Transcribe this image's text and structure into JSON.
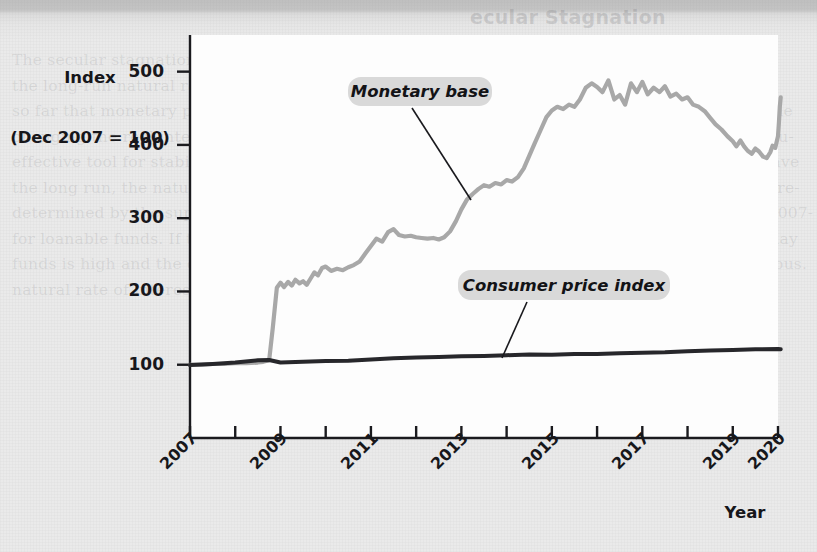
{
  "figure": {
    "y_axis_title_line1": "Index",
    "y_axis_title_line2": "(Dec 2007 = 100)",
    "x_axis_title": "Year"
  },
  "background_page": {
    "heading": "ecular Stagnation",
    "column_text_left": "The secular stagnation hypothesis argues that\nthe long-run natural rate of interest has fallen\nso far that monetary policy, which works by\nchanging the real interest rate, is no longer an\neffective tool for stabilizing the economy. Over\nthe long run, the natural rate of interest is\ndetermined by the supply of and the demand\nfor loanable funds. If the supply of loanable\nfunds is high and the demand is low, then the\nnatural rate of interest will be low.",
    "column_text_right": "There are several reasons why the supply of\nloanable funds may have increased and the\ndemand for loanable funds decreased over the\npast few decades. First, the aging of the popu-\nlation in many high-income countries may have\nincreased saving as workers prepare for retire-\nment. Second, the global financial crisis of 2007-\n2009 and the COVID-19 pandemic of 2020 may\nhave made households and firms more cautious."
  },
  "chart_data": {
    "type": "line",
    "title": "",
    "xlabel": "Year",
    "ylabel": "Index (Dec 2007 = 100)",
    "xlim": [
      2007,
      2020
    ],
    "ylim": [
      0,
      550
    ],
    "grid": false,
    "legend_position": "inline-annotation",
    "y_ticks": [
      100,
      200,
      300,
      400,
      500
    ],
    "x_ticks": [
      2007,
      2008,
      2009,
      2010,
      2011,
      2012,
      2013,
      2014,
      2015,
      2016,
      2017,
      2018,
      2019,
      2020
    ],
    "x_tick_labels": [
      "2007",
      "",
      "2009",
      "",
      "2011",
      "",
      "2013",
      "",
      "2015",
      "",
      "2017",
      "",
      "2019",
      "2020"
    ],
    "x_labeled_ticks": [
      {
        "x": 2007,
        "label": "2007"
      },
      {
        "x": 2009,
        "label": "2009"
      },
      {
        "x": 2011,
        "label": "2011"
      },
      {
        "x": 2013,
        "label": "2013"
      },
      {
        "x": 2015,
        "label": "2015"
      },
      {
        "x": 2017,
        "label": "2017"
      },
      {
        "x": 2019,
        "label": "2019"
      },
      {
        "x": 2020,
        "label": "2020"
      }
    ],
    "series": [
      {
        "name": "Monetary base",
        "label": "Monetary base",
        "color": "#a8a8a8",
        "width": 4.2,
        "annotation": {
          "text": "Monetary base",
          "box_x": 348,
          "box_y": 77,
          "box_w": 144,
          "box_h": 29,
          "leader_from": [
            412,
            108
          ],
          "leader_to": [
            471,
            200
          ]
        },
        "points": [
          [
            2007.0,
            100
          ],
          [
            2007.25,
            100
          ],
          [
            2007.5,
            101
          ],
          [
            2007.75,
            101
          ],
          [
            2008.0,
            102
          ],
          [
            2008.25,
            102
          ],
          [
            2008.5,
            103
          ],
          [
            2008.62,
            104
          ],
          [
            2008.75,
            106
          ],
          [
            2008.83,
            150
          ],
          [
            2008.92,
            205
          ],
          [
            2009.0,
            212
          ],
          [
            2009.08,
            206
          ],
          [
            2009.17,
            213
          ],
          [
            2009.25,
            208
          ],
          [
            2009.33,
            216
          ],
          [
            2009.42,
            211
          ],
          [
            2009.5,
            214
          ],
          [
            2009.58,
            209
          ],
          [
            2009.67,
            218
          ],
          [
            2009.75,
            226
          ],
          [
            2009.83,
            222
          ],
          [
            2009.92,
            232
          ],
          [
            2010.0,
            234
          ],
          [
            2010.12,
            228
          ],
          [
            2010.25,
            231
          ],
          [
            2010.38,
            229
          ],
          [
            2010.5,
            233
          ],
          [
            2010.62,
            236
          ],
          [
            2010.75,
            241
          ],
          [
            2010.88,
            252
          ],
          [
            2011.0,
            262
          ],
          [
            2011.12,
            272
          ],
          [
            2011.25,
            268
          ],
          [
            2011.38,
            281
          ],
          [
            2011.5,
            285
          ],
          [
            2011.62,
            277
          ],
          [
            2011.75,
            275
          ],
          [
            2011.88,
            276
          ],
          [
            2012.0,
            274
          ],
          [
            2012.12,
            273
          ],
          [
            2012.25,
            272
          ],
          [
            2012.38,
            273
          ],
          [
            2012.5,
            271
          ],
          [
            2012.62,
            274
          ],
          [
            2012.75,
            282
          ],
          [
            2012.88,
            296
          ],
          [
            2013.0,
            312
          ],
          [
            2013.12,
            325
          ],
          [
            2013.25,
            333
          ],
          [
            2013.38,
            340
          ],
          [
            2013.5,
            345
          ],
          [
            2013.62,
            343
          ],
          [
            2013.75,
            348
          ],
          [
            2013.88,
            346
          ],
          [
            2014.0,
            352
          ],
          [
            2014.12,
            350
          ],
          [
            2014.25,
            356
          ],
          [
            2014.38,
            368
          ],
          [
            2014.5,
            385
          ],
          [
            2014.62,
            402
          ],
          [
            2014.75,
            420
          ],
          [
            2014.88,
            438
          ],
          [
            2015.0,
            447
          ],
          [
            2015.12,
            452
          ],
          [
            2015.25,
            449
          ],
          [
            2015.38,
            455
          ],
          [
            2015.5,
            452
          ],
          [
            2015.62,
            462
          ],
          [
            2015.75,
            478
          ],
          [
            2015.88,
            484
          ],
          [
            2016.0,
            479
          ],
          [
            2016.12,
            472
          ],
          [
            2016.25,
            488
          ],
          [
            2016.38,
            462
          ],
          [
            2016.5,
            468
          ],
          [
            2016.62,
            455
          ],
          [
            2016.75,
            484
          ],
          [
            2016.88,
            472
          ],
          [
            2017.0,
            486
          ],
          [
            2017.12,
            469
          ],
          [
            2017.25,
            478
          ],
          [
            2017.38,
            472
          ],
          [
            2017.5,
            480
          ],
          [
            2017.62,
            466
          ],
          [
            2017.75,
            470
          ],
          [
            2017.88,
            462
          ],
          [
            2018.0,
            465
          ],
          [
            2018.12,
            455
          ],
          [
            2018.25,
            452
          ],
          [
            2018.38,
            446
          ],
          [
            2018.5,
            437
          ],
          [
            2018.62,
            428
          ],
          [
            2018.75,
            421
          ],
          [
            2018.88,
            412
          ],
          [
            2019.0,
            405
          ],
          [
            2019.08,
            398
          ],
          [
            2019.17,
            406
          ],
          [
            2019.25,
            398
          ],
          [
            2019.33,
            392
          ],
          [
            2019.42,
            388
          ],
          [
            2019.5,
            395
          ],
          [
            2019.58,
            391
          ],
          [
            2019.67,
            384
          ],
          [
            2019.75,
            382
          ],
          [
            2019.83,
            390
          ],
          [
            2019.88,
            399
          ],
          [
            2019.94,
            396
          ],
          [
            2020.0,
            412
          ],
          [
            2020.02,
            430
          ],
          [
            2020.04,
            452
          ],
          [
            2020.06,
            465
          ]
        ]
      },
      {
        "name": "Consumer price index",
        "label": "Consumer price index",
        "color": "#27272b",
        "width": 4.0,
        "annotation": {
          "text": "Consumer price index",
          "box_x": 458,
          "box_y": 270,
          "box_w": 212,
          "box_h": 30,
          "leader_from": [
            527,
            302
          ],
          "leader_to": [
            502,
            358
          ]
        },
        "points": [
          [
            2007.0,
            99.5
          ],
          [
            2007.5,
            101
          ],
          [
            2008.0,
            103
          ],
          [
            2008.5,
            106
          ],
          [
            2008.75,
            106.5
          ],
          [
            2009.0,
            103
          ],
          [
            2009.5,
            104
          ],
          [
            2010.0,
            105
          ],
          [
            2010.5,
            105.5
          ],
          [
            2011.0,
            107
          ],
          [
            2011.5,
            109
          ],
          [
            2012.0,
            110
          ],
          [
            2012.5,
            110.5
          ],
          [
            2013.0,
            111.5
          ],
          [
            2013.5,
            112
          ],
          [
            2014.0,
            113
          ],
          [
            2014.5,
            114
          ],
          [
            2015.0,
            113.5
          ],
          [
            2015.5,
            114.5
          ],
          [
            2016.0,
            114.5
          ],
          [
            2016.5,
            115.5
          ],
          [
            2017.0,
            116.5
          ],
          [
            2017.5,
            117
          ],
          [
            2018.0,
            118.5
          ],
          [
            2018.5,
            119.5
          ],
          [
            2019.0,
            120
          ],
          [
            2019.5,
            121
          ],
          [
            2020.0,
            121.5
          ],
          [
            2020.06,
            121
          ]
        ]
      }
    ]
  }
}
